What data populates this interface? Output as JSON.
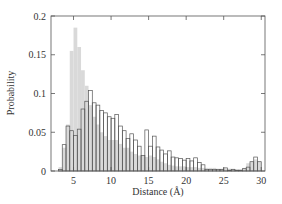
{
  "chart_data": {
    "type": "bar",
    "subtype": "overlaid-histogram",
    "title": "",
    "xlabel": "Distance (Å)",
    "ylabel": "Probability",
    "xlim": [
      2,
      30.5
    ],
    "ylim": [
      0,
      0.2
    ],
    "xticks": [
      5,
      10,
      15,
      20,
      25,
      30
    ],
    "yticks": [
      0,
      0.05,
      0.1,
      0.15,
      0.2
    ],
    "ytick_labels": [
      "0",
      "0.05",
      "0.1",
      "0.15",
      "0.2"
    ],
    "xtick_labels": [
      "5",
      "10",
      "15",
      "20",
      "25",
      "30"
    ],
    "grid": false,
    "legend": null,
    "bin_width": 0.5,
    "bin_starts": [
      3.0,
      3.5,
      4.0,
      4.5,
      5.0,
      5.5,
      6.0,
      6.5,
      7.0,
      7.5,
      8.0,
      8.5,
      9.0,
      9.5,
      10.0,
      10.5,
      11.0,
      11.5,
      12.0,
      12.5,
      13.0,
      13.5,
      14.0,
      14.5,
      15.0,
      15.5,
      16.0,
      16.5,
      17.0,
      17.5,
      18.0,
      18.5,
      19.0,
      19.5,
      20.0,
      20.5,
      21.0,
      21.5,
      22.0,
      22.5,
      23.0,
      23.5,
      24.0,
      24.5,
      25.0,
      25.5,
      26.0,
      26.5,
      27.0,
      27.5,
      28.0,
      28.5,
      29.0,
      29.5
    ],
    "series": [
      {
        "name": "filled (gray)",
        "style": "filled",
        "color": "#d9d9d9",
        "values": [
          0.005,
          0.03,
          0.06,
          0.155,
          0.185,
          0.16,
          0.13,
          0.11,
          0.085,
          0.07,
          0.06,
          0.05,
          0.045,
          0.04,
          0.04,
          0.04,
          0.035,
          0.03,
          0.03,
          0.025,
          0.022,
          0.02,
          0.02,
          0.018,
          0.02,
          0.018,
          0.015,
          0.012,
          0.01,
          0.008,
          0.007,
          0.006,
          0.006,
          0.006,
          0.005,
          0.005,
          0.005,
          0.004,
          0.004,
          0.004,
          0.004,
          0.004,
          0.003,
          0.003,
          0.003,
          0.003,
          0.003,
          0.002,
          0.002,
          0.004,
          0.01,
          0.012,
          0.015,
          0.012
        ]
      },
      {
        "name": "open (outline)",
        "style": "outline",
        "color": "#555555",
        "values": [
          0.002,
          0.034,
          0.058,
          0.052,
          0.046,
          0.054,
          0.08,
          0.09,
          0.104,
          0.088,
          0.085,
          0.078,
          0.075,
          0.07,
          0.068,
          0.073,
          0.058,
          0.052,
          0.042,
          0.048,
          0.04,
          0.032,
          0.02,
          0.053,
          0.032,
          0.045,
          0.031,
          0.027,
          0.022,
          0.026,
          0.018,
          0.017,
          0.016,
          0.014,
          0.016,
          0.013,
          0.017,
          0.011,
          0.008,
          0.002,
          0.002,
          0.002,
          0.002,
          0.002,
          0.004,
          0.001,
          0.002,
          0.001,
          0.001,
          0.003,
          0.005,
          0.012,
          0.018,
          0.012
        ]
      }
    ]
  }
}
